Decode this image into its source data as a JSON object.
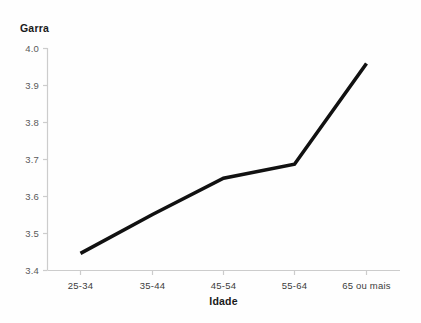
{
  "chart_data": {
    "type": "line",
    "title": "",
    "xlabel": "Idade",
    "ylabel": "Garra",
    "categories": [
      "25-34",
      "35-44",
      "45-54",
      "55-64",
      "65 ou mais"
    ],
    "values": [
      3.445,
      3.55,
      3.648,
      3.686,
      3.958
    ],
    "series": [
      {
        "name": "Garra",
        "values": [
          3.445,
          3.55,
          3.648,
          3.686,
          3.958
        ]
      }
    ],
    "ylim": [
      3.4,
      4.0
    ],
    "yticks": [
      "3.4",
      "3.5",
      "3.6",
      "3.7",
      "3.8",
      "3.9",
      "4.0"
    ],
    "ytick_values": [
      3.4,
      3.5,
      3.6,
      3.7,
      3.8,
      3.9,
      4.0
    ],
    "grid": false,
    "legend": false,
    "legend_position": "none",
    "line_color": "#111111",
    "axis_color": "#cccccc",
    "background_color": "#fefefe"
  },
  "labels": {
    "y_axis_title": "Garra",
    "x_axis_title": "Idade",
    "ytick_0": "3.4",
    "ytick_1": "3.5",
    "ytick_2": "3.6",
    "ytick_3": "3.7",
    "ytick_4": "3.8",
    "ytick_5": "3.9",
    "ytick_6": "4.0",
    "xtick_0": "25-34",
    "xtick_1": "35-44",
    "xtick_2": "45-54",
    "xtick_3": "55-64",
    "xtick_4": "65 ou mais"
  }
}
